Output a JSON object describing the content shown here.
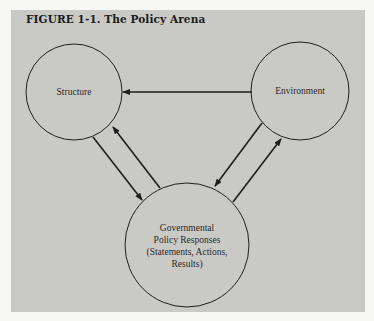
{
  "figure": {
    "title": "FIGURE 1-1. The Policy Arena"
  },
  "nodes": {
    "structure": {
      "label": "Structure"
    },
    "environment": {
      "label": "Environment"
    },
    "government": {
      "lines": [
        "Governmental",
        "Policy Responses",
        "(Statements, Actions,",
        "Results)"
      ]
    }
  },
  "edges": [
    {
      "from": "Environment",
      "to": "Structure"
    },
    {
      "from": "Structure",
      "to": "Governmental Policy Responses"
    },
    {
      "from": "Governmental Policy Responses",
      "to": "Structure"
    },
    {
      "from": "Environment",
      "to": "Governmental Policy Responses"
    },
    {
      "from": "Governmental Policy Responses",
      "to": "Environment"
    }
  ],
  "colors": {
    "panel": "#c9c9c6",
    "background": "#f7f7f5",
    "stroke": "#1e1e1e"
  }
}
